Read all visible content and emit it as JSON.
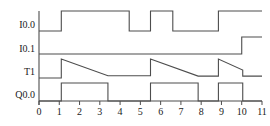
{
  "figure": {
    "kind": "plc-timing-diagram",
    "background_color": "#ffffff",
    "line_color": "#4d4d4d",
    "text_color": "#1a1a1a"
  },
  "chart_data": {
    "type": "line",
    "title": "",
    "xlabel": "",
    "ylabel": "",
    "xlim": [
      0,
      11
    ],
    "ylim": [
      0,
      1
    ],
    "grid": false,
    "legend_position": "left-axis-labels",
    "x_ticks": [
      0,
      1,
      2,
      3,
      4,
      5,
      6,
      7,
      8,
      9,
      10,
      11
    ],
    "x_tick_labels": [
      "0",
      "1",
      "2",
      "3",
      "4",
      "5",
      "6",
      "7",
      "8",
      "9",
      "10",
      "11"
    ],
    "series": [
      {
        "name": "I0.0",
        "signal_type": "digital",
        "points": [
          [
            0,
            0
          ],
          [
            1.1,
            0
          ],
          [
            1.1,
            1
          ],
          [
            4.45,
            1
          ],
          [
            4.45,
            0
          ],
          [
            5.5,
            0
          ],
          [
            5.5,
            1
          ],
          [
            6.6,
            1
          ],
          [
            6.6,
            0
          ],
          [
            8.85,
            0
          ],
          [
            8.85,
            1
          ],
          [
            11,
            1
          ]
        ]
      },
      {
        "name": "I0.1",
        "signal_type": "digital",
        "points": [
          [
            0,
            0
          ],
          [
            10.0,
            0
          ],
          [
            10.0,
            1
          ],
          [
            11,
            1
          ]
        ]
      },
      {
        "name": "T1",
        "signal_type": "analog-sawtooth",
        "points": [
          [
            0,
            0
          ],
          [
            1.1,
            0
          ],
          [
            1.1,
            1
          ],
          [
            3.4,
            0.12
          ],
          [
            5.5,
            0.12
          ],
          [
            5.5,
            1
          ],
          [
            7.85,
            0.1
          ],
          [
            8.85,
            0.1
          ],
          [
            8.85,
            1
          ],
          [
            10.05,
            0.42
          ],
          [
            10.05,
            0.1
          ],
          [
            11,
            0.1
          ]
        ]
      },
      {
        "name": "Q0.0",
        "signal_type": "digital",
        "points": [
          [
            0,
            0
          ],
          [
            1.1,
            0
          ],
          [
            1.1,
            1
          ],
          [
            3.4,
            1
          ],
          [
            3.4,
            0
          ],
          [
            5.5,
            0
          ],
          [
            5.5,
            1
          ],
          [
            7.85,
            1
          ],
          [
            7.85,
            0
          ],
          [
            8.85,
            0
          ],
          [
            8.85,
            1
          ],
          [
            10.05,
            1
          ],
          [
            10.05,
            0
          ],
          [
            11,
            0
          ]
        ]
      }
    ]
  },
  "axis_labels": {
    "rows": [
      {
        "id": "row-i00",
        "label": "I0.0"
      },
      {
        "id": "row-i01",
        "label": "I0.1"
      },
      {
        "id": "row-t1",
        "label": "T1"
      },
      {
        "id": "row-q00",
        "label": "Q0.0"
      }
    ]
  }
}
